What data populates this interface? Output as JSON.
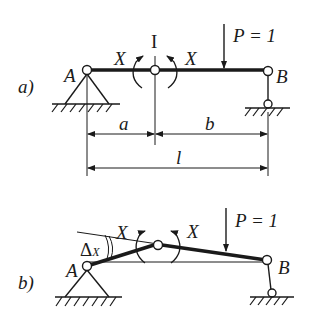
{
  "figure": {
    "panel_a": {
      "label": "a)",
      "support_left": "A",
      "support_right": "B",
      "hinge_label": "I",
      "moment_left": "X",
      "moment_right": "X",
      "load": "P = 1",
      "dim_a": "a",
      "dim_b": "b",
      "dim_l": "l"
    },
    "panel_b": {
      "label": "b)",
      "support_left": "A",
      "support_right": "B",
      "moment_left": "X",
      "moment_right": "X",
      "load": "P = 1",
      "rotation_symbol": "Δ",
      "rotation_subscript": "X"
    },
    "colors": {
      "ink": "#1a1a1a",
      "background": "#ffffff"
    }
  }
}
